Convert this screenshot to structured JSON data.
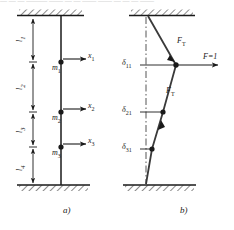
{
  "figure": {
    "panel_a": {
      "caption": "a)",
      "segments": [
        {
          "name": "l1",
          "label": "l",
          "sub": "1"
        },
        {
          "name": "l2",
          "label": "l",
          "sub": "2"
        },
        {
          "name": "l3",
          "label": "l",
          "sub": "3"
        },
        {
          "name": "l4",
          "label": "l",
          "sub": "4"
        }
      ],
      "masses": [
        {
          "name": "m1",
          "label": "m",
          "sub": "1"
        },
        {
          "name": "m2",
          "label": "m",
          "sub": "2"
        },
        {
          "name": "m3",
          "label": "m",
          "sub": "3"
        }
      ],
      "displacements": [
        {
          "name": "x1",
          "label": "x",
          "sub": "1"
        },
        {
          "name": "x2",
          "label": "x",
          "sub": "2"
        },
        {
          "name": "x3",
          "label": "x",
          "sub": "3"
        }
      ],
      "supports": [
        "top-fixed-support",
        "bottom-fixed-support"
      ]
    },
    "panel_b": {
      "caption": "b)",
      "applied_force": {
        "label": "F",
        "equals": "=1"
      },
      "internal_forces": [
        {
          "name": "FT-upper",
          "label": "F",
          "sub": "T"
        },
        {
          "name": "FT-lower",
          "label": "F",
          "sub": "T"
        }
      ],
      "deflections": [
        {
          "name": "delta11",
          "label": "δ",
          "sub": "11"
        },
        {
          "name": "delta21",
          "label": "δ",
          "sub": "21"
        },
        {
          "name": "delta31",
          "label": "δ",
          "sub": "31"
        }
      ],
      "supports": [
        "top-fixed-support",
        "bottom-fixed-support"
      ],
      "centerline": "dash-dot-axis"
    },
    "colors": {
      "line": "#1a1a1a",
      "hatch": "#333333",
      "background": "#ffffff"
    }
  },
  "page_artifact": {
    "clipped_text_line": "— — —   ———  ——  — — ——  —— —  — — ——"
  }
}
